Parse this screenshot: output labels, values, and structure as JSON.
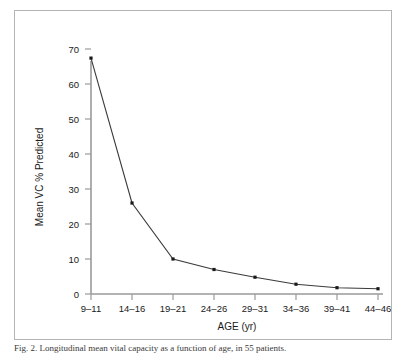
{
  "figure": {
    "caption": "Fig. 2. Longitudinal mean vital capacity as a function of age, in 55 patients."
  },
  "chart_data": {
    "type": "line",
    "title": "",
    "xlabel": "AGE (yr)",
    "ylabel": "Mean VC % Predicted",
    "categories": [
      "9–11",
      "14–16",
      "19–21",
      "24–26",
      "29–31",
      "34–36",
      "39–41",
      "44–46"
    ],
    "values": [
      67.4,
      26.0,
      10.0,
      7.0,
      4.8,
      2.8,
      1.8,
      1.5
    ],
    "ylim": [
      0,
      74
    ],
    "yticks": [
      0,
      10,
      20,
      30,
      40,
      50,
      60,
      70
    ],
    "ytick_labels": [
      "0",
      "10",
      "20",
      "30",
      "40",
      "50",
      "60",
      "70"
    ],
    "grid": false,
    "legend": "none",
    "marker": "square",
    "line_color": "#3a3a3a",
    "marker_color": "#1a1a1a",
    "axis_color": "#9a9a9a"
  }
}
